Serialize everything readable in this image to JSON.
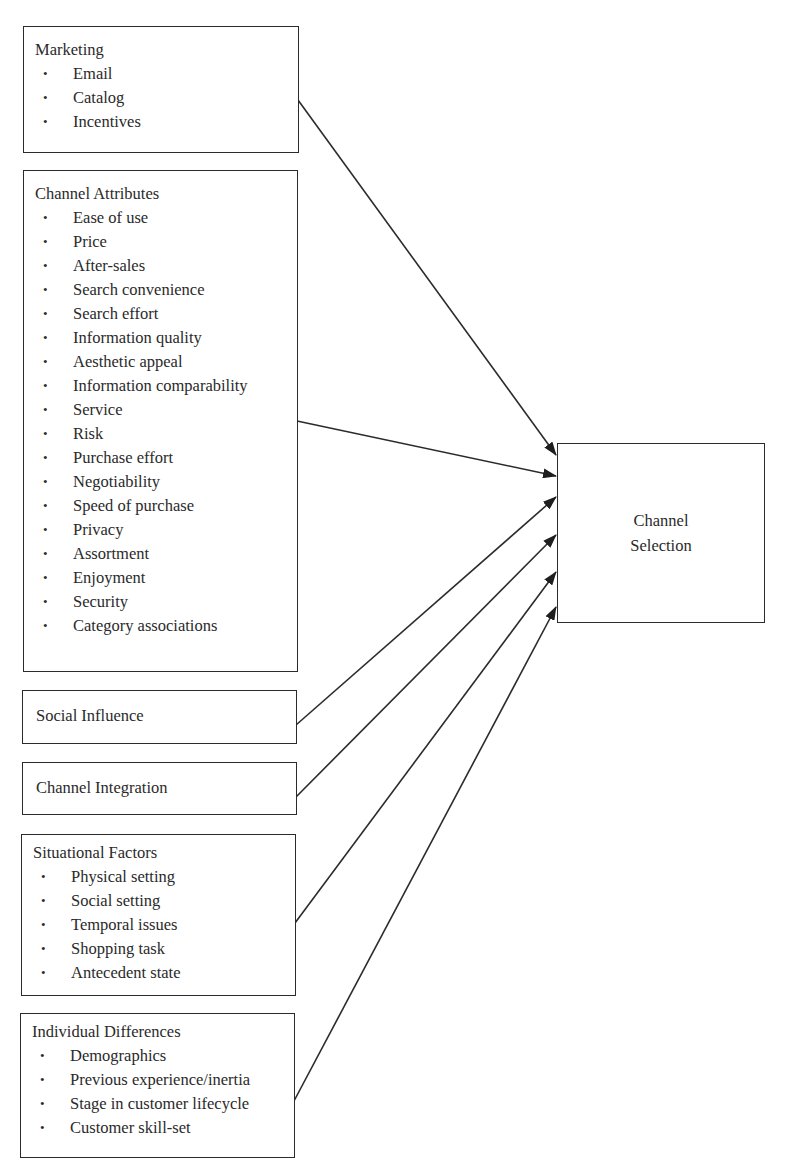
{
  "diagram": {
    "target": {
      "label_line1": "Channel",
      "label_line2": "Selection"
    },
    "factors": {
      "marketing": {
        "title": "Marketing",
        "items": [
          "Email",
          "Catalog",
          "Incentives"
        ]
      },
      "channel_attributes": {
        "title": "Channel Attributes",
        "items": [
          "Ease of use",
          "Price",
          "After-sales",
          "Search convenience",
          "Search effort",
          "Information quality",
          "Aesthetic appeal",
          "Information comparability",
          "Service",
          "Risk",
          "Purchase effort",
          "Negotiability",
          "Speed of purchase",
          "Privacy",
          "Assortment",
          "Enjoyment",
          "Security",
          "Category associations"
        ]
      },
      "social_influence": {
        "title": "Social Influence"
      },
      "channel_integration": {
        "title": "Channel Integration"
      },
      "situational_factors": {
        "title": "Situational Factors",
        "items": [
          "Physical setting",
          "Social setting",
          "Temporal issues",
          "Shopping task",
          "Antecedent state"
        ]
      },
      "individual_differences": {
        "title": "Individual Differences",
        "items": [
          "Demographics",
          "Previous experience/inertia",
          "Stage in customer lifecycle",
          "Customer skill-set"
        ]
      }
    },
    "bullet_glyph": "•",
    "line_color": "#2b2b2b"
  }
}
